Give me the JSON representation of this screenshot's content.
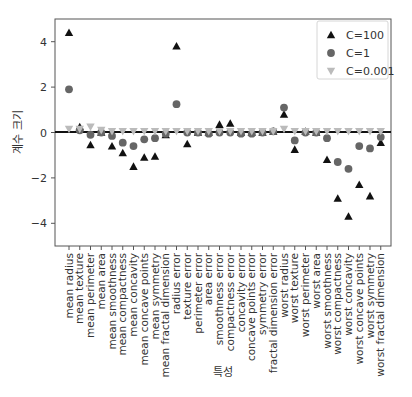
{
  "chart_data": {
    "type": "scatter",
    "title": "",
    "xlabel": "특성",
    "ylabel": "계수 크기",
    "ylim": [
      -5,
      5
    ],
    "yticks": [
      4,
      2,
      0,
      -2,
      -4
    ],
    "ytick_labels": [
      "4",
      "2",
      "0",
      "−2",
      "−4"
    ],
    "grid": false,
    "legend_position": "upper right",
    "hline_at": 0,
    "categories": [
      "mean radius",
      "mean texture",
      "mean perimeter",
      "mean area",
      "mean smoothness",
      "mean compactness",
      "mean concavity",
      "mean concave points",
      "mean symmetry",
      "mean fractal dimension",
      "radius error",
      "texture error",
      "perimeter error",
      "area error",
      "smoothness error",
      "compactness error",
      "concavity error",
      "concave points error",
      "symmetry error",
      "fractal dimension error",
      "worst radius",
      "worst texture",
      "worst perimeter",
      "worst area",
      "worst smoothness",
      "worst compactness",
      "worst concavity",
      "worst concave points",
      "worst symmetry",
      "worst fractal dimension"
    ],
    "series": [
      {
        "name": "C=100",
        "marker": "triangle-up",
        "color": "#111111",
        "values": [
          4.4,
          0.25,
          -0.55,
          0.0,
          -0.6,
          -0.9,
          -1.5,
          -1.1,
          -1.05,
          -0.1,
          3.8,
          -0.5,
          0.0,
          0.0,
          0.35,
          0.4,
          0.0,
          0.0,
          0.0,
          0.05,
          0.8,
          -0.75,
          0.05,
          0.0,
          -1.2,
          -2.9,
          -3.7,
          -2.3,
          -2.8,
          -0.45
        ]
      },
      {
        "name": "C=1",
        "marker": "circle",
        "color": "#666666",
        "values": [
          1.9,
          0.1,
          -0.1,
          0.0,
          -0.15,
          -0.45,
          -0.6,
          -0.3,
          -0.25,
          -0.05,
          1.25,
          0.0,
          0.0,
          -0.05,
          0.0,
          0.0,
          -0.05,
          -0.05,
          0.0,
          0.05,
          1.1,
          -0.35,
          0.0,
          0.0,
          -0.25,
          -1.3,
          -1.6,
          -0.6,
          -0.7,
          -0.2
        ]
      },
      {
        "name": "C=0.001",
        "marker": "triangle-down",
        "color": "#bbbbbb",
        "values": [
          0.15,
          0.15,
          0.25,
          0.1,
          0.05,
          0.05,
          0.05,
          0.05,
          0.05,
          0.05,
          0.05,
          0.05,
          0.05,
          0.05,
          0.05,
          0.05,
          0.05,
          0.05,
          0.05,
          0.05,
          0.15,
          0.05,
          0.05,
          0.05,
          0.05,
          0.05,
          0.05,
          0.05,
          0.05,
          0.05
        ]
      }
    ]
  },
  "legend": {
    "items": [
      {
        "label": "C=100"
      },
      {
        "label": "C=1"
      },
      {
        "label": "C=0.001"
      }
    ]
  },
  "axes": {
    "xlabel": "특성",
    "ylabel": "계수 크기"
  }
}
